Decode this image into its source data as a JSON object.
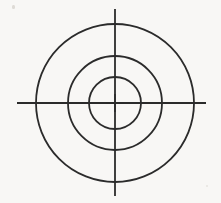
{
  "figure": {
    "background_color": "#f8f7f5",
    "ink_color": "#2b2b2b",
    "width": 221,
    "height": 203
  },
  "chart_data": {
    "type": "scatter",
    "subtitle": "",
    "xlabel": "",
    "ylabel": "",
    "xlim": [
      0,
      221
    ],
    "ylim": [
      0,
      203
    ],
    "grid": false,
    "legend": false,
    "legend_position": "none",
    "tick_labels_x": [],
    "tick_labels_y": [],
    "annotations": [],
    "center": {
      "x": 115,
      "y": 103
    },
    "circles": [
      {
        "name": "outer-circle",
        "cx": 115,
        "cy": 103,
        "r": 79,
        "stroke": "#2b2b2b",
        "stroke_width": 1.8,
        "fill": "none"
      },
      {
        "name": "middle-circle",
        "cx": 115,
        "cy": 103,
        "r": 47,
        "stroke": "#2b2b2b",
        "stroke_width": 1.8,
        "fill": "none"
      },
      {
        "name": "inner-circle",
        "cx": 115,
        "cy": 103,
        "r": 26,
        "stroke": "#2b2b2b",
        "stroke_width": 1.8,
        "fill": "none"
      }
    ],
    "lines": [
      {
        "name": "horizontal-axis",
        "x1": 17,
        "y1": 103,
        "x2": 206,
        "y2": 103,
        "stroke": "#2b2b2b",
        "stroke_width": 1.8
      },
      {
        "name": "vertical-axis",
        "x1": 115,
        "y1": 9,
        "x2": 115,
        "y2": 196,
        "stroke": "#2b2b2b",
        "stroke_width": 1.8
      }
    ],
    "center_marker": {
      "name": "center-crosshair",
      "half_length": 9,
      "stroke": "#2b2b2b",
      "stroke_width": 1.6
    }
  }
}
